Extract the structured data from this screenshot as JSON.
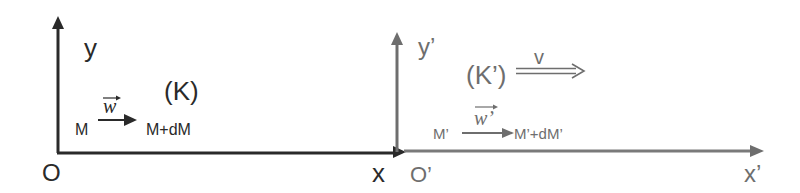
{
  "frame_k": {
    "name": "(K)",
    "y_axis_label": "y",
    "x_axis_label": "x",
    "origin_label": "O",
    "point_start": "M",
    "point_end": "M+dM",
    "vector_label": "w",
    "color": "#2a2a2a"
  },
  "frame_k_prime": {
    "name": "(K’)",
    "y_axis_label": "y’",
    "x_axis_label": "x’",
    "origin_label": "O’",
    "point_start": "M’",
    "point_end": "M’+dM’",
    "vector_label": "w’",
    "velocity_label": "v",
    "color": "#6e6e6e"
  }
}
